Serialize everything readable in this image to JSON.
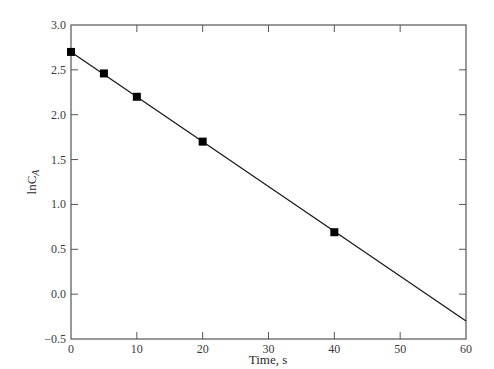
{
  "chart_data": {
    "type": "scatter",
    "title": "",
    "xlabel": "Time, s",
    "ylabel": "lnC",
    "ylabel_subscript": "A",
    "xlim": [
      0,
      60
    ],
    "ylim": [
      -0.5,
      3.0
    ],
    "xticks": [
      0,
      10,
      20,
      30,
      40,
      50,
      60
    ],
    "yticks": [
      -0.5,
      0.0,
      0.5,
      1.0,
      1.5,
      2.0,
      2.5,
      3.0
    ],
    "ytick_labels": [
      "−0.5",
      "0.0",
      "0.5",
      "1.0",
      "1.5",
      "2.0",
      "2.5",
      "3.0"
    ],
    "grid": false,
    "legend": null,
    "series": [
      {
        "name": "data",
        "marker": "square",
        "x": [
          0,
          5,
          10,
          20,
          40
        ],
        "y": [
          2.7,
          2.46,
          2.2,
          1.7,
          0.69
        ]
      },
      {
        "name": "linear fit",
        "style": "line",
        "x": [
          0,
          60
        ],
        "y": [
          2.7,
          -0.3
        ]
      }
    ]
  },
  "colors": {
    "axis": "#555555",
    "line": "#1a1a1a",
    "marker": "#000000"
  }
}
